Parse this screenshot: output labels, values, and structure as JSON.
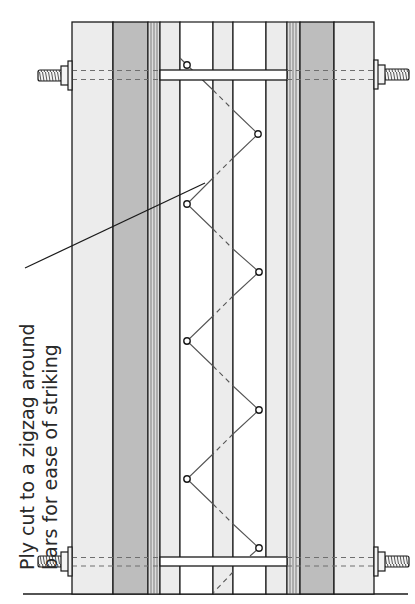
{
  "diagram": {
    "annotation": {
      "line1": "Ply cut to a zigzag around",
      "line2": "bars for ease of striking"
    },
    "colors": {
      "outline": "#1a1a1a",
      "light_timber": "#ececec",
      "dark_timber": "#bdbdbd",
      "white_gap": "#ffffff",
      "zigzag": "#555555",
      "dashed_bar": "#6e6e6e"
    },
    "components": {
      "outer_panels": 2,
      "dark_bearers": 2,
      "laminated_plies": 2,
      "inner_strips": 3,
      "tie_bars": 2,
      "nuts_and_threaded_ends": 4,
      "zigzag_vertices": 8
    }
  }
}
